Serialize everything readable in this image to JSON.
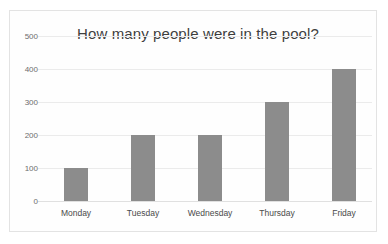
{
  "chart_data": {
    "type": "bar",
    "title": "How many people were in the pool?",
    "xlabel": "",
    "ylabel": "",
    "categories": [
      "Monday",
      "Tuesday",
      "Wednesday",
      "Thursday",
      "Friday"
    ],
    "values": [
      100,
      200,
      200,
      300,
      400
    ],
    "ylim": [
      0,
      500
    ],
    "yticks": [
      0,
      100,
      200,
      300,
      400,
      500
    ],
    "ytick_labels": [
      "0",
      "100",
      "200",
      "300",
      "400",
      "500"
    ],
    "grid": true,
    "grid_axis": "y",
    "legend": false,
    "legend_position": "none",
    "series": [
      {
        "name": "People in the pool",
        "values": [
          100,
          200,
          200,
          300,
          400
        ]
      }
    ]
  },
  "style": {
    "bar_color": "#8c8c8c",
    "grid_color": "#ebebeb",
    "title_color": "#3f3f3f",
    "tick_color": "#6d6d6d",
    "category_color": "#4a4a4a",
    "frame_color": "#e3e3e3",
    "background": "#fefefe"
  }
}
